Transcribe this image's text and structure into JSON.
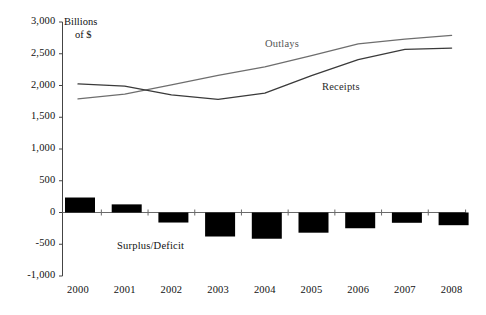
{
  "chart_data": {
    "type": "line",
    "title": "",
    "subtitle": "",
    "xlabel": "",
    "ylabel": "Billions of $",
    "ylabel_line1": "Billions",
    "ylabel_line2": "of $",
    "grid": false,
    "legend_position": "inline-annotation",
    "ylim": [
      -1000,
      3000
    ],
    "ytick_values": [
      3000,
      2500,
      2000,
      1500,
      1000,
      500,
      0,
      -500,
      -1000
    ],
    "ytick_labels": [
      "3,000",
      "2,500",
      "2,000",
      "1,500",
      "1,000",
      "500",
      "0",
      "-500",
      "-1,000"
    ],
    "categories": [
      "2000",
      "2001",
      "2002",
      "2003",
      "2004",
      "2005",
      "2006",
      "2007",
      "2008"
    ],
    "xtick_labels": [
      "2000",
      "2001",
      "2002",
      "2003",
      "2004",
      "2005",
      "2006",
      "2007",
      "2008"
    ],
    "series": [
      {
        "name": "Outlays",
        "label": "Outlays",
        "type": "line",
        "color": "#6e6e6e",
        "values": [
          1790,
          1863,
          2011,
          2160,
          2293,
          2472,
          2655,
          2730,
          2790
        ]
      },
      {
        "name": "Receipts",
        "label": "Receipts",
        "type": "line",
        "color": "#3a3a3a",
        "values": [
          2025,
          1991,
          1853,
          1782,
          1880,
          2154,
          2407,
          2568,
          2590
        ]
      },
      {
        "name": "Surplus/Deficit",
        "label": "Surplus/Deficit",
        "type": "bar",
        "color": "#000000",
        "values": [
          236,
          128,
          -158,
          -378,
          -413,
          -318,
          -248,
          -162,
          -200
        ]
      }
    ],
    "annotations": [
      {
        "text": "Outlays",
        "x": 2005,
        "y": 2720
      },
      {
        "text": "Receipts",
        "x": 2006.3,
        "y": 2020
      },
      {
        "text": "Surplus/Deficit",
        "x": 2001.6,
        "y": -430
      }
    ]
  },
  "axis": {
    "y_axis_name": "vertical-axis",
    "x_axis_name": "zero-baseline"
  }
}
